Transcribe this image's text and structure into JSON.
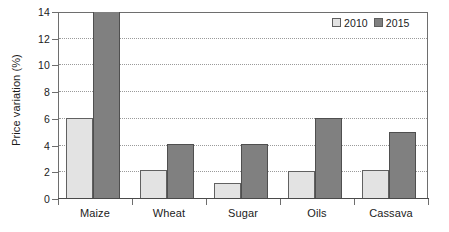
{
  "chart_data": {
    "type": "bar",
    "title": "",
    "xlabel": "",
    "ylabel": "Price variation (%)",
    "categories": [
      "Maize",
      "Wheat",
      "Sugar",
      "Oils",
      "Cassava"
    ],
    "series": [
      {
        "name": "2010",
        "color": "#e3e3e3",
        "values": [
          6.1,
          2.15,
          1.2,
          2.1,
          2.15
        ]
      },
      {
        "name": "2015",
        "color": "#808080",
        "values": [
          14.2,
          4.1,
          4.1,
          6.05,
          5.05
        ]
      }
    ],
    "ylim": [
      0,
      14
    ],
    "yticks": [
      0,
      2,
      4,
      6,
      8,
      10,
      12,
      14
    ],
    "ytick_labels": [
      "0",
      "2",
      "4",
      "6",
      "8",
      "10",
      "12",
      "14"
    ],
    "grid": "horizontal-dotted",
    "grid_color": "#9a9a9a",
    "legend_position": "top-right",
    "legend_entries": [
      "2010",
      "2015"
    ]
  },
  "axis": {
    "line_color": "#6e6e6e",
    "baseline_color": "#4a4a4a",
    "text_color": "#1b1b1b"
  },
  "figure": {
    "background": "#ffffff",
    "width": 449,
    "height": 232
  }
}
